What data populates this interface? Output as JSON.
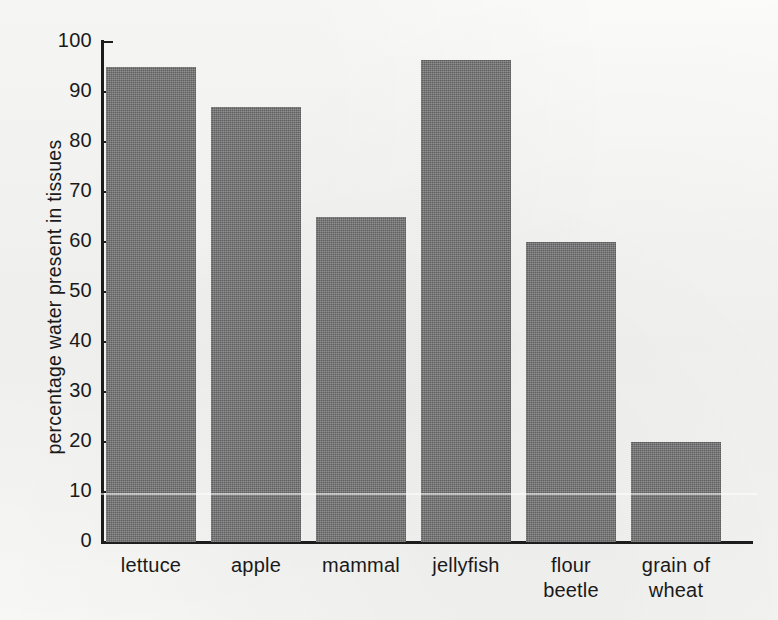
{
  "chart_data": {
    "type": "bar",
    "title": "",
    "xlabel": "",
    "ylabel": "percentage water present in tissues",
    "categories": [
      "lettuce",
      "apple",
      "mammal",
      "jellyfish",
      "flour beetle",
      "grain of wheat"
    ],
    "category_lines": [
      [
        "lettuce"
      ],
      [
        "apple"
      ],
      [
        "mammal"
      ],
      [
        "jellyfish"
      ],
      [
        "flour",
        "beetle"
      ],
      [
        "grain of",
        "wheat"
      ]
    ],
    "values": [
      95,
      87,
      65,
      96.5,
      60,
      20
    ],
    "ylim": [
      0,
      100
    ],
    "ytick_labels": [
      "0",
      "10",
      "20",
      "30",
      "40",
      "50",
      "60",
      "70",
      "80",
      "90",
      "100"
    ],
    "ytick_values": [
      0,
      10,
      20,
      30,
      40,
      50,
      60,
      70,
      80,
      90,
      100
    ],
    "grid": false,
    "legend": false,
    "bar_color": "#767676",
    "axis_color": "#1c1c1c",
    "background_color": "#f7f7f5"
  }
}
